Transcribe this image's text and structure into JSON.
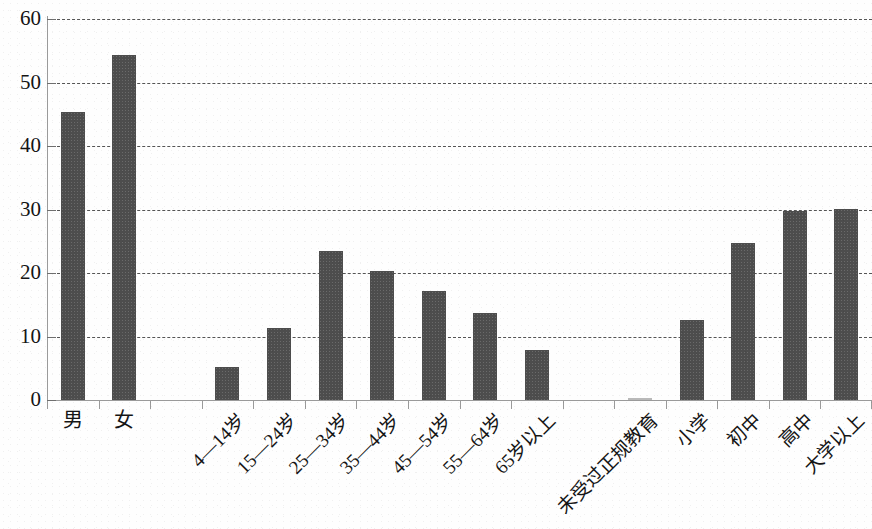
{
  "chart_data": {
    "type": "bar",
    "title": "",
    "xlabel": "",
    "ylabel": "",
    "ylim": [
      0,
      60
    ],
    "ytick_labels": [
      "0",
      "10",
      "20",
      "30",
      "40",
      "50",
      "60"
    ],
    "ytick_values": [
      0,
      10,
      20,
      30,
      40,
      50,
      60
    ],
    "grid": true,
    "grid_style": "dashed",
    "legend": "none",
    "orientation": "vertical",
    "bar_color": "#4d4d4d",
    "axis_color": "#9a9a9a",
    "grid_color": "#555555",
    "categories": [
      "男",
      "女",
      "",
      "4—14岁",
      "15—24岁",
      "25—34岁",
      "35—44岁",
      "45—54岁",
      "55—64岁",
      "65岁以上",
      "",
      "未受过正规教育",
      "小学",
      "初中",
      "高中",
      "大学以上"
    ],
    "values": [
      45.3,
      54.3,
      null,
      5.2,
      11.4,
      23.5,
      20.3,
      17.1,
      13.7,
      7.8,
      null,
      0.2,
      12.6,
      24.7,
      29.8,
      30.1
    ],
    "groups": [
      {
        "name": "性别",
        "categories": [
          "男",
          "女"
        ]
      },
      {
        "name": "年龄",
        "categories": [
          "4—14岁",
          "15—24岁",
          "25—34岁",
          "35—44岁",
          "45—54岁",
          "55—64岁",
          "65岁以上"
        ]
      },
      {
        "name": "受教育程度",
        "categories": [
          "未受过正规教育",
          "小学",
          "初中",
          "高中",
          "大学以上"
        ]
      }
    ]
  }
}
